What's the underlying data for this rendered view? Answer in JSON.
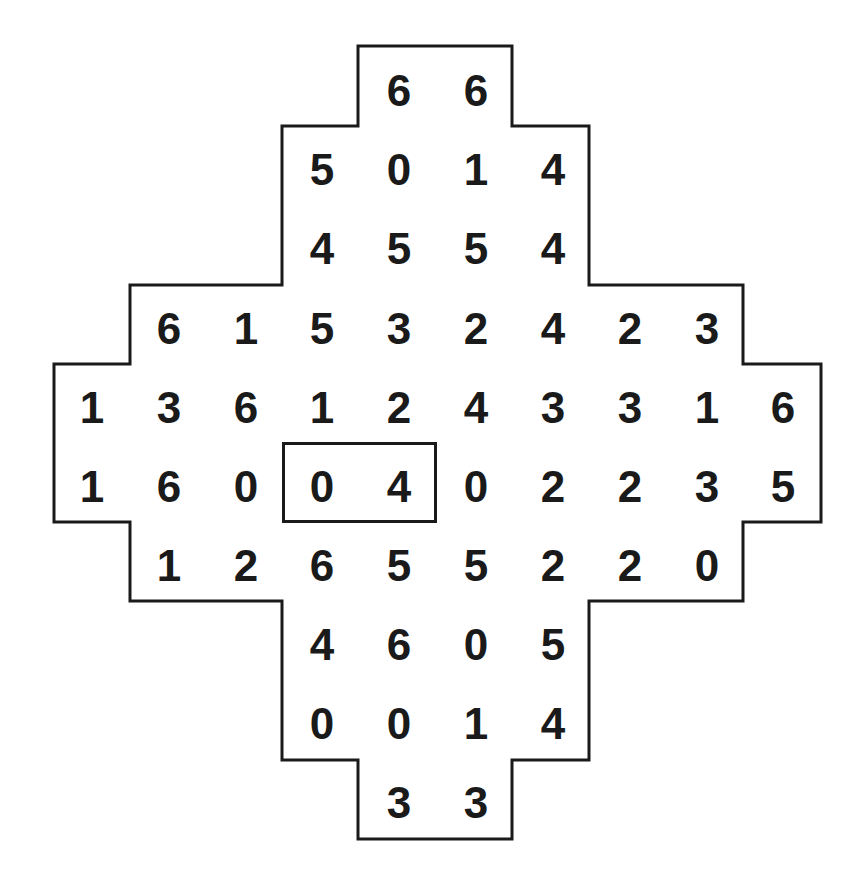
{
  "puzzle": {
    "type": "number-grid",
    "layout": {
      "col_x": [
        92,
        169,
        246,
        322,
        399,
        476,
        553,
        630,
        707,
        783
      ],
      "row_y": [
        91,
        170,
        249,
        329,
        408,
        487,
        566,
        645,
        724,
        803
      ]
    },
    "rows": [
      {
        "cols": [
          4,
          5
        ],
        "values": [
          "6",
          "6"
        ]
      },
      {
        "cols": [
          3,
          4,
          5,
          6
        ],
        "values": [
          "5",
          "0",
          "1",
          "4"
        ]
      },
      {
        "cols": [
          3,
          4,
          5,
          6
        ],
        "values": [
          "4",
          "5",
          "5",
          "4"
        ]
      },
      {
        "cols": [
          1,
          2,
          3,
          4,
          5,
          6,
          7,
          8
        ],
        "values": [
          "6",
          "1",
          "5",
          "3",
          "2",
          "4",
          "2",
          "3"
        ]
      },
      {
        "cols": [
          0,
          1,
          2,
          3,
          4,
          5,
          6,
          7,
          8,
          9
        ],
        "values": [
          "1",
          "3",
          "6",
          "1",
          "2",
          "4",
          "3",
          "3",
          "1",
          "6"
        ]
      },
      {
        "cols": [
          0,
          1,
          2,
          3,
          4,
          5,
          6,
          7,
          8,
          9
        ],
        "values": [
          "1",
          "6",
          "0",
          "0",
          "4",
          "0",
          "2",
          "2",
          "3",
          "5"
        ]
      },
      {
        "cols": [
          1,
          2,
          3,
          4,
          5,
          6,
          7,
          8
        ],
        "values": [
          "1",
          "2",
          "6",
          "5",
          "5",
          "2",
          "2",
          "0"
        ]
      },
      {
        "cols": [
          3,
          4,
          5,
          6
        ],
        "values": [
          "4",
          "6",
          "0",
          "5"
        ]
      },
      {
        "cols": [
          3,
          4,
          5,
          6
        ],
        "values": [
          "0",
          "0",
          "1",
          "4"
        ]
      },
      {
        "cols": [
          4,
          5
        ],
        "values": [
          "3",
          "3"
        ]
      }
    ],
    "highlighted_pair": {
      "row": 5,
      "cols": [
        3,
        4
      ],
      "values": [
        "0",
        "4"
      ],
      "box": {
        "left": 282,
        "top": 442,
        "width": 155,
        "height": 81
      }
    },
    "outline_points": "358,46 512,46 512,126 589,126 589,285 743,285 743,364 821,364 821,522 743,522 743,601 589,601 589,760 512,760 512,839 358,839 358,760 282,760 282,601 130,601 130,522 54,522 54,364 130,364 130,285 282,285 282,126 358,126",
    "colors": {
      "ink": "#1a1a1a",
      "background": "#ffffff"
    }
  }
}
